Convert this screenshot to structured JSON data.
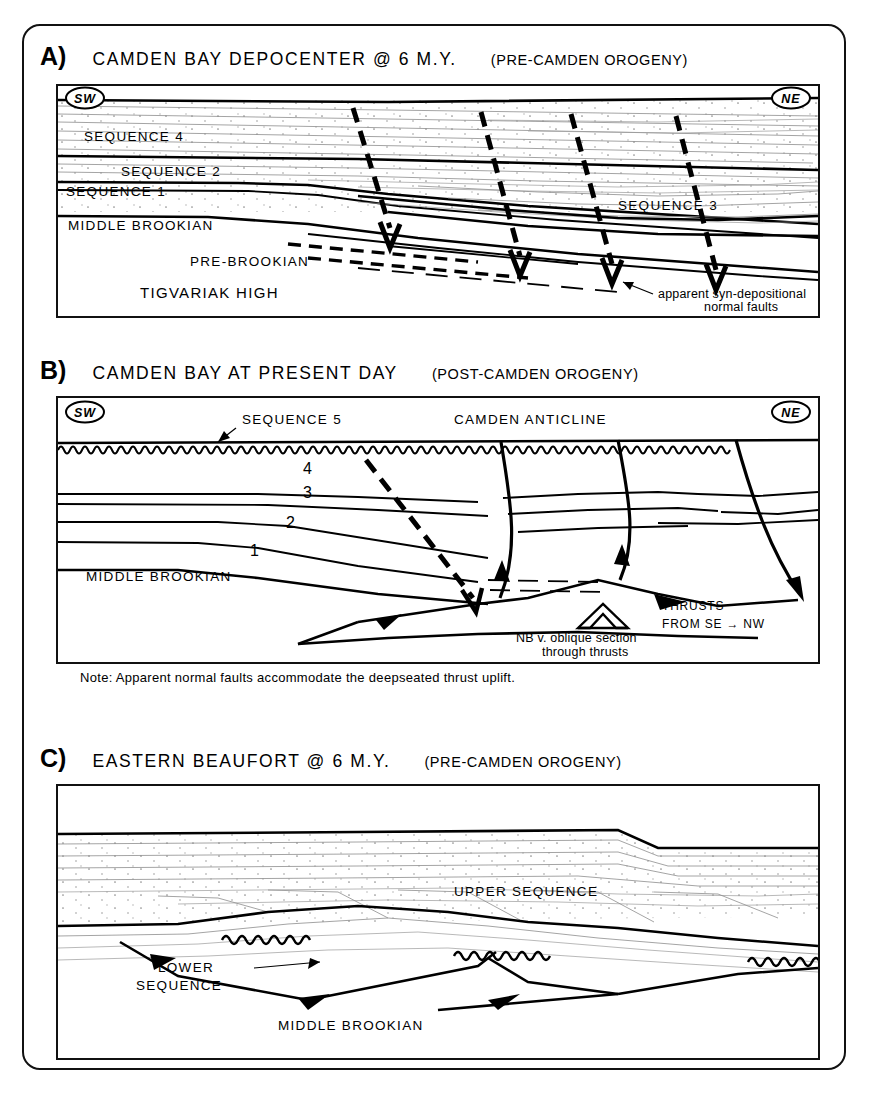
{
  "figure": {
    "panels": [
      {
        "letter": "A)",
        "title": "CAMDEN BAY DEPOCENTER @ 6 M.Y.",
        "subtitle": "(PRE-CAMDEN OROGENY)",
        "compass_left": "SW",
        "compass_right": "NE",
        "labels": {
          "sequence4": "SEQUENCE 4",
          "sequence2": "SEQUENCE 2",
          "sequence1": "SEQUENCE 1",
          "sequence3": "SEQUENCE 3",
          "middle_brookian": "MIDDLE BROOKIAN",
          "pre_brookian": "PRE-BROOKIAN",
          "tigvariak_high": "TIGVARIAK HIGH",
          "fault_note_line1": "apparent syn-depositional",
          "fault_note_line2": "normal faults"
        }
      },
      {
        "letter": "B)",
        "title": "CAMDEN BAY AT PRESENT DAY",
        "subtitle": "(POST-CAMDEN OROGENY)",
        "compass_left": "SW",
        "compass_right": "NE",
        "labels": {
          "sequence5": "SEQUENCE 5",
          "camden_anticline": "CAMDEN ANTICLINE",
          "num4": "4",
          "num3": "3",
          "num2": "2",
          "num1": "1",
          "middle_brookian": "MIDDLE BROOKIAN",
          "thrusts_line1": "THRUSTS",
          "thrusts_line2": "FROM SE → NW",
          "oblique_line1": "NB v. oblique section",
          "oblique_line2": "through thrusts"
        },
        "note": "Note: Apparent normal faults accommodate the deepseated thrust uplift."
      },
      {
        "letter": "C)",
        "title": "EASTERN BEAUFORT @ 6 M.Y.",
        "subtitle": "(PRE-CAMDEN OROGENY)",
        "labels": {
          "upper_sequence": "UPPER SEQUENCE",
          "lower_sequence_line1": "LOWER",
          "lower_sequence_line2": "SEQUENCE",
          "middle_brookian": "MIDDLE BROOKIAN"
        }
      }
    ]
  },
  "colors": {
    "ink": "#111111",
    "stipple": "#8d8d8d",
    "paper": "#ffffff"
  }
}
